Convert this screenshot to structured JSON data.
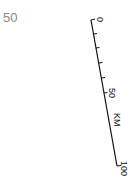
{
  "corner_label": "50",
  "scale_bar": {
    "unit": "KM",
    "labels": [
      "0",
      "50",
      "100"
    ],
    "color": "#111111",
    "minor_ticks": 5
  }
}
